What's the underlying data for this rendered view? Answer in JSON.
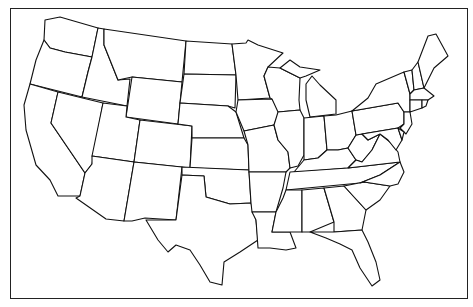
{
  "map": {
    "type": "outline-map",
    "subject": "Contiguous United States state boundaries",
    "labels": [],
    "colors": {
      "stroke": "#111111",
      "fill": "#ffffff",
      "background": "#ffffff"
    }
  }
}
